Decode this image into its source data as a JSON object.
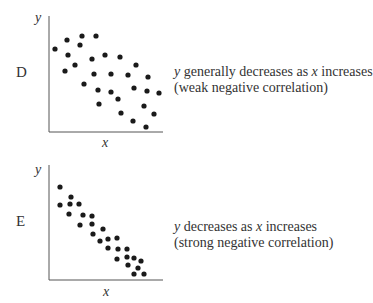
{
  "panels": [
    {
      "id": "D",
      "letter": "D",
      "y_label": "y",
      "x_label": "x",
      "caption_line1": {
        "pre": "",
        "y": "y",
        "mid": " generally decreases as ",
        "x": "x",
        "post": " increases"
      },
      "caption_line2": "(weak negative correlation)",
      "axes": {
        "x0": 49,
        "y0": 132,
        "x1": 163,
        "ytop": 16
      },
      "points": [
        [
          55,
          49
        ],
        [
          67,
          40
        ],
        [
          82,
          36
        ],
        [
          96,
          36
        ],
        [
          80,
          45
        ],
        [
          68,
          55
        ],
        [
          92,
          59
        ],
        [
          105,
          55
        ],
        [
          120,
          57
        ],
        [
          75,
          65
        ],
        [
          65,
          71
        ],
        [
          94,
          74
        ],
        [
          111,
          74
        ],
        [
          128,
          75
        ],
        [
          136,
          65
        ],
        [
          148,
          77
        ],
        [
          84,
          84
        ],
        [
          98,
          90
        ],
        [
          111,
          92
        ],
        [
          134,
          88
        ],
        [
          147,
          91
        ],
        [
          159,
          93
        ],
        [
          118,
          99
        ],
        [
          99,
          104
        ],
        [
          144,
          106
        ],
        [
          121,
          113
        ],
        [
          154,
          114
        ],
        [
          133,
          121
        ],
        [
          146,
          127
        ]
      ]
    },
    {
      "id": "E",
      "letter": "E",
      "y_label": "y",
      "x_label": "x",
      "caption_line1": {
        "pre": "",
        "y": "y",
        "mid": " decreases as ",
        "x": "x",
        "post": " increases"
      },
      "caption_line2": "(strong negative correlation)",
      "axes": {
        "x0": 49,
        "y0": 280,
        "x1": 163,
        "ytop": 165
      },
      "points": [
        [
          60,
          187
        ],
        [
          71,
          197
        ],
        [
          60,
          205
        ],
        [
          70,
          204
        ],
        [
          79,
          204
        ],
        [
          69,
          214
        ],
        [
          83,
          215
        ],
        [
          92,
          216
        ],
        [
          80,
          225
        ],
        [
          92,
          224
        ],
        [
          103,
          229
        ],
        [
          93,
          234
        ],
        [
          100,
          241
        ],
        [
          108,
          239
        ],
        [
          117,
          238
        ],
        [
          108,
          248
        ],
        [
          118,
          249
        ],
        [
          127,
          249
        ],
        [
          117,
          259
        ],
        [
          127,
          257
        ],
        [
          134,
          258
        ],
        [
          141,
          261
        ],
        [
          128,
          265
        ],
        [
          138,
          268
        ],
        [
          134,
          274
        ],
        [
          144,
          274
        ]
      ]
    }
  ],
  "chart_data": [
    {
      "type": "scatter",
      "title": "D",
      "xlabel": "x",
      "ylabel": "y",
      "annotation": "y generally decreases as x increases (weak negative correlation)",
      "grid": false,
      "note": "points in pixel coordinates (x right, y down)",
      "points": [
        [
          55,
          49
        ],
        [
          67,
          40
        ],
        [
          82,
          36
        ],
        [
          96,
          36
        ],
        [
          80,
          45
        ],
        [
          68,
          55
        ],
        [
          92,
          59
        ],
        [
          105,
          55
        ],
        [
          120,
          57
        ],
        [
          75,
          65
        ],
        [
          65,
          71
        ],
        [
          94,
          74
        ],
        [
          111,
          74
        ],
        [
          128,
          75
        ],
        [
          136,
          65
        ],
        [
          148,
          77
        ],
        [
          84,
          84
        ],
        [
          98,
          90
        ],
        [
          111,
          92
        ],
        [
          134,
          88
        ],
        [
          147,
          91
        ],
        [
          159,
          93
        ],
        [
          118,
          99
        ],
        [
          99,
          104
        ],
        [
          144,
          106
        ],
        [
          121,
          113
        ],
        [
          154,
          114
        ],
        [
          133,
          121
        ],
        [
          146,
          127
        ]
      ]
    },
    {
      "type": "scatter",
      "title": "E",
      "xlabel": "x",
      "ylabel": "y",
      "annotation": "y decreases as x increases (strong negative correlation)",
      "grid": false,
      "note": "points in pixel coordinates (x right, y down)",
      "points": [
        [
          60,
          187
        ],
        [
          71,
          197
        ],
        [
          60,
          205
        ],
        [
          70,
          204
        ],
        [
          79,
          204
        ],
        [
          69,
          214
        ],
        [
          83,
          215
        ],
        [
          92,
          216
        ],
        [
          80,
          225
        ],
        [
          92,
          224
        ],
        [
          103,
          229
        ],
        [
          93,
          234
        ],
        [
          100,
          241
        ],
        [
          108,
          239
        ],
        [
          117,
          238
        ],
        [
          108,
          248
        ],
        [
          118,
          249
        ],
        [
          127,
          249
        ],
        [
          117,
          259
        ],
        [
          127,
          257
        ],
        [
          134,
          258
        ],
        [
          141,
          261
        ],
        [
          128,
          265
        ],
        [
          138,
          268
        ],
        [
          134,
          274
        ],
        [
          144,
          274
        ]
      ]
    }
  ]
}
